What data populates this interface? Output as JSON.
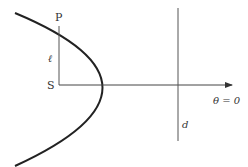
{
  "diagram": {
    "type": "conic-polar-parabola",
    "labels": {
      "point": "P",
      "focus": "S",
      "distance": "ℓ",
      "directrix": "d",
      "initial_line": "θ = 0"
    },
    "colors": {
      "curve": "#222222",
      "lines": "#444444",
      "text": "#333333"
    }
  }
}
